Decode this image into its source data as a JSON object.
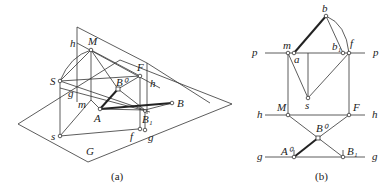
{
  "figure": {
    "panel_a": {
      "caption": "(a)",
      "labels": {
        "h_top": "h",
        "M": "M",
        "S": "S",
        "F": "F",
        "h_right": "h",
        "B0": "B⁰",
        "g_left": "g",
        "m": "m",
        "A": "A",
        "B": "B",
        "B1": "B₁",
        "s": "s",
        "f": "f",
        "g_right": "g",
        "G": "G"
      }
    },
    "panel_b": {
      "caption": "(b)",
      "labels": {
        "b": "b",
        "p_left": "p",
        "p_right": "p",
        "m": "m",
        "a": "a",
        "b1": "b₁",
        "f": "f",
        "s": "s",
        "h_left": "h",
        "M": "M",
        "F": "F",
        "h_right": "h",
        "B0": "B⁰",
        "g_left": "g",
        "A0": "A⁰",
        "B1": "B₁",
        "g_right": "g"
      }
    }
  }
}
